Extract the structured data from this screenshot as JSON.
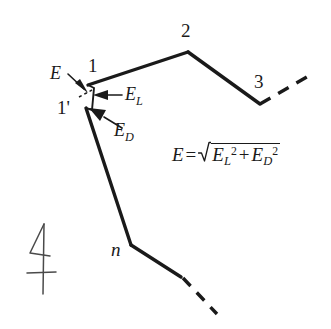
{
  "figure": {
    "background_color": "#ffffff",
    "ink_color": "#1a1a1a",
    "nodes": [
      {
        "id": "node-1",
        "label": "1",
        "x": 88,
        "y": 85,
        "label_x": 88,
        "label_y": 60
      },
      {
        "id": "node-1-prime",
        "label": "1'",
        "x": 86,
        "y": 108,
        "label_x": 58,
        "label_y": 100
      },
      {
        "id": "node-2",
        "label": "2",
        "x": 188,
        "y": 52,
        "label_x": 182,
        "label_y": 25
      },
      {
        "id": "node-3",
        "label": "3",
        "x": 260,
        "y": 104,
        "label_x": 255,
        "label_y": 76
      },
      {
        "id": "node-n",
        "label": "n",
        "x": 131,
        "y": 245,
        "label_x": 112,
        "label_y": 241
      }
    ],
    "vectors": [
      {
        "id": "vector-E",
        "label": "E",
        "subscript": "",
        "label_x": 51,
        "label_y": 68
      },
      {
        "id": "vector-E-L",
        "label": "E",
        "subscript": "L",
        "label_x": 126,
        "label_y": 88
      },
      {
        "id": "vector-E-D",
        "label": "E",
        "subscript": "D",
        "label_x": 115,
        "label_y": 124
      }
    ],
    "equation": {
      "lhs": "E",
      "operator": "=",
      "radicand_term_1": "E",
      "radicand_term_1_sub": "L",
      "radicand_term_1_sup": "2",
      "plus": "+",
      "radicand_term_2": "E",
      "radicand_term_2_sub": "D",
      "radicand_term_2_sup": "2"
    },
    "orientation_mark": {
      "id": "north-arrow-mark",
      "description": "hand-drawn arrow with crossbar"
    }
  }
}
